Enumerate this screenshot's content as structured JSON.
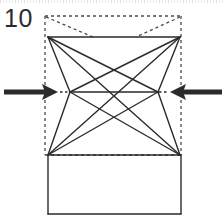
{
  "figure": {
    "step_number": "10",
    "type": "origami-fold-diagram",
    "canvas": {
      "width": 224,
      "height": 221
    },
    "colors": {
      "stroke": "#2b2b2b",
      "dashed_stroke": "#4a4a4a",
      "arrow": "#2b2b2b",
      "paper_fill": "#ffffff",
      "background": "#ffffff"
    },
    "stroke_widths": {
      "solid": 1.4,
      "dashed": 1.3,
      "arrow_shaft": 5
    },
    "dash_patterns": {
      "outline": "3,3",
      "diagonal": "3,3",
      "arrow_gap": "2.5,2.5"
    },
    "geometry": {
      "dashed_rect": {
        "left": 45,
        "top": 16,
        "right": 181,
        "bottom": 155
      },
      "top_left": {
        "x": 48,
        "y": 37
      },
      "top_right": {
        "x": 180,
        "y": 37
      },
      "bottom_left": {
        "x": 48,
        "y": 155
      },
      "bottom_right": {
        "x": 180,
        "y": 155
      },
      "notch_left": {
        "x": 70,
        "y": 92
      },
      "notch_right": {
        "x": 158,
        "y": 92
      },
      "center_cross": {
        "x": 114,
        "y": 92
      },
      "lower_rect": {
        "left": 48,
        "top": 155,
        "right": 181,
        "bottom": 214
      },
      "dashed_diag_left_end": {
        "x": 93,
        "y": 37
      },
      "dashed_diag_right_end": {
        "x": 136,
        "y": 37
      }
    },
    "arrows": [
      {
        "name": "left-arrow",
        "direction": "right",
        "shaft_start_x": 4,
        "shaft_end_x": 46,
        "tip_x": 58,
        "y": 92,
        "dash_start_x": 59,
        "dash_end_x": 69
      },
      {
        "name": "right-arrow",
        "direction": "left",
        "shaft_start_x": 222,
        "shaft_end_x": 181,
        "tip_x": 170,
        "y": 92,
        "dash_start_x": 159,
        "dash_end_x": 169
      }
    ]
  }
}
